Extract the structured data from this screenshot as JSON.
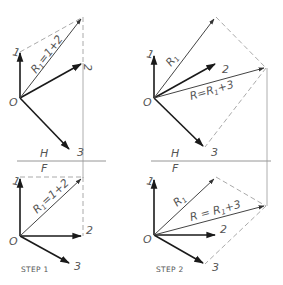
{
  "diagram": {
    "type": "vector-addition-descriptive-geometry",
    "reference_line": {
      "upper_label": "H",
      "lower_label": "F"
    },
    "steps": [
      {
        "caption": "STEP 1",
        "origin_label": "O",
        "vector_labels": [
          "1",
          "2",
          "3"
        ],
        "resultant_label": "R₁=1+2",
        "resultant_parts": {
          "R": "R",
          "sub": "1",
          "expr": "=1+2"
        }
      },
      {
        "caption": "STEP 2",
        "origin_label": "O",
        "vector_labels": [
          "1",
          "2",
          "3"
        ],
        "partial_label": "R₁",
        "partial_parts": {
          "R": "R",
          "sub": "1"
        },
        "resultant_label": "R=R₁+3",
        "resultant_parts_top": {
          "R": "R=R",
          "sub": "1",
          "expr": "+3"
        },
        "resultant_parts_bottom": {
          "R": "R = R",
          "sub": "1",
          "expr": "+3"
        }
      }
    ]
  },
  "colors": {
    "vector": "#1a1a1a",
    "dashed_construction": "#a0a0a0",
    "projection": "#9a9a9a",
    "text": "#555555",
    "background": "#ffffff"
  }
}
